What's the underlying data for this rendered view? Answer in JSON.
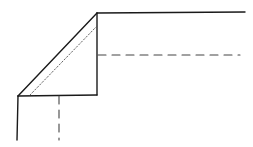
{
  "diagram": {
    "type": "line-drawing",
    "colors": {
      "background": "#ffffff",
      "stroke": "#1a1a1a",
      "dashed": "#444444",
      "dotted": "#555555"
    },
    "solid_lines": [
      {
        "id": "top-edge",
        "x1": 97,
        "y1": 13,
        "x2": 245,
        "y2": 12
      },
      {
        "id": "right-vertical",
        "x1": 97,
        "y1": 13,
        "x2": 97,
        "y2": 95
      },
      {
        "id": "bottom-edge",
        "x1": 18,
        "y1": 96,
        "x2": 97,
        "y2": 95
      },
      {
        "id": "left-vertical",
        "x1": 18,
        "y1": 96,
        "x2": 17,
        "y2": 140
      },
      {
        "id": "diagonal",
        "x1": 18,
        "y1": 96,
        "x2": 97,
        "y2": 13
      }
    ],
    "dotted_lines": [
      {
        "id": "inner-diagonal",
        "x1": 30,
        "y1": 95,
        "x2": 97,
        "y2": 26
      }
    ],
    "dashed_lines": [
      {
        "id": "horizontal-guide",
        "x1": 98,
        "y1": 55,
        "x2": 240,
        "y2": 55
      },
      {
        "id": "vertical-guide",
        "x1": 59,
        "y1": 96,
        "x2": 59,
        "y2": 140
      }
    ]
  }
}
